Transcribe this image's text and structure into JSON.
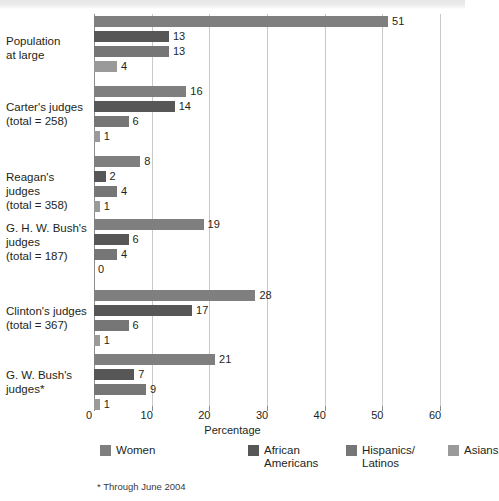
{
  "chart_data": {
    "type": "bar",
    "orientation": "horizontal",
    "title": "",
    "xlabel": "Percentage",
    "ylabel": "",
    "xlim": [
      0,
      60
    ],
    "xticks": [
      0,
      10,
      20,
      30,
      40,
      50,
      60
    ],
    "grid": true,
    "legend_position": "bottom",
    "footnote": "* Through June 2004",
    "categories": [
      "Population\nat large",
      "Carter's judges\n(total = 258)",
      "Reagan's judges\n(total = 358)",
      "G. H. W. Bush's\njudges\n(total = 187)",
      "Clinton's judges\n(total = 367)",
      "G. W. Bush's\njudges*"
    ],
    "series": [
      {
        "name": "Women",
        "color": "#7f7f7f",
        "values": [
          51,
          16,
          8,
          19,
          28,
          21
        ]
      },
      {
        "name": "African\nAmericans",
        "color": "#575757",
        "values": [
          13,
          14,
          2,
          6,
          17,
          7
        ]
      },
      {
        "name": "Hispanics/\nLatinos",
        "color": "#767676",
        "values": [
          13,
          6,
          4,
          4,
          6,
          9
        ]
      },
      {
        "name": "Asians",
        "color": "#9a9a9a",
        "values": [
          4,
          1,
          1,
          0,
          1,
          1
        ]
      }
    ]
  },
  "legend": {
    "items": [
      {
        "label": "Women",
        "color": "#7f7f7f"
      },
      {
        "label": "African\nAmericans",
        "color": "#575757"
      },
      {
        "label": "Hispanics/\nLatinos",
        "color": "#767676"
      },
      {
        "label": "Asians",
        "color": "#9a9a9a"
      }
    ]
  },
  "axis": {
    "title": "Percentage",
    "tick_labels": [
      "0",
      "10",
      "20",
      "30",
      "40",
      "50",
      "60"
    ]
  },
  "footnote": {
    "text": "* Through June 2004"
  }
}
